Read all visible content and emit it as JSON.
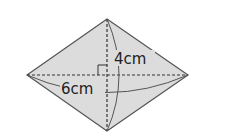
{
  "diagram": {
    "shape": "rhombus",
    "fill_color": "#dcdcdc",
    "stroke_color": "#555555",
    "vertices": {
      "top": [
        107,
        19
      ],
      "right": [
        188,
        75
      ],
      "bottom": [
        107,
        131
      ],
      "left": [
        27,
        75
      ]
    },
    "labels": {
      "vertical_diagonal": "4cm",
      "horizontal_diagonal": "6cm"
    },
    "right_angle_marker": true
  }
}
